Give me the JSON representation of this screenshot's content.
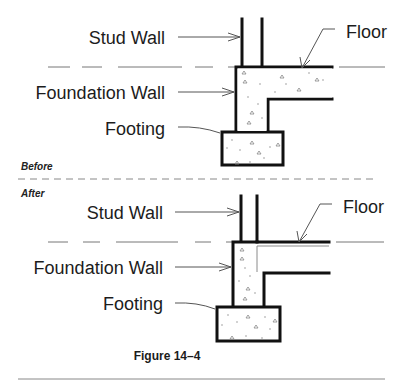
{
  "figure": {
    "caption": "Figure 14–4",
    "divider_color": "#888888",
    "line_color": "#111111"
  },
  "before": {
    "section_label": "Before",
    "labels": {
      "stud_wall": "Stud Wall",
      "foundation_wall": "Foundation Wall",
      "footing": "Footing",
      "floor": "Floor"
    }
  },
  "after": {
    "section_label": "After",
    "labels": {
      "stud_wall": "Stud Wall",
      "foundation_wall": "Foundation Wall",
      "footing": "Footing",
      "floor": "Floor"
    }
  }
}
